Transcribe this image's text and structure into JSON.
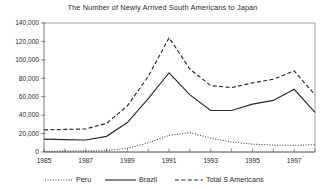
{
  "chart_data": {
    "type": "line",
    "title": "The Number of Newly Arrived South Americans to Japan",
    "xlabel": "",
    "ylabel": "",
    "x": [
      1985,
      1986,
      1987,
      1988,
      1989,
      1990,
      1991,
      1992,
      1993,
      1994,
      1995,
      1996,
      1997,
      1998
    ],
    "xlim": [
      1985,
      1998
    ],
    "ylim": [
      0,
      140000
    ],
    "ytick_values": [
      0,
      20000,
      40000,
      60000,
      80000,
      100000,
      120000,
      140000
    ],
    "ytick_labels": [
      "0",
      "20,000",
      "40,000",
      "60,000",
      "80,000",
      "100,000",
      "120,000",
      "140,000"
    ],
    "xtick_values": [
      1985,
      1987,
      1989,
      1991,
      1993,
      1995,
      1997
    ],
    "xtick_labels": [
      "1985",
      "1987",
      "1989",
      "1991",
      "1993",
      "1995",
      "1997"
    ],
    "xtick_minor": [
      1986,
      1988,
      1990,
      1992,
      1994,
      1996,
      1998
    ],
    "grid": false,
    "legend_position": "bottom",
    "series": [
      {
        "name": "Peru",
        "style": "dotted",
        "color": "#3a3a3a",
        "values": [
          700,
          1000,
          1100,
          1500,
          4000,
          10000,
          18000,
          21000,
          15000,
          11000,
          8500,
          7500,
          7200,
          8000
        ]
      },
      {
        "name": "Brazil",
        "style": "solid",
        "color": "#2a2a2a",
        "values": [
          14000,
          13500,
          13000,
          17000,
          32000,
          58000,
          86000,
          62000,
          45000,
          45000,
          52000,
          56000,
          68000,
          43000
        ]
      },
      {
        "name": "Total S Americans",
        "style": "dashed",
        "color": "#2a2a2a",
        "values": [
          24000,
          24500,
          25000,
          31000,
          50000,
          82000,
          124000,
          90000,
          72000,
          70000,
          75000,
          79000,
          88000,
          62000
        ]
      }
    ]
  },
  "legend": {
    "items": [
      {
        "label": "Peru",
        "style": "dotted"
      },
      {
        "label": "Brazil",
        "style": "solid"
      },
      {
        "label": "Total S Americans",
        "style": "dashed"
      }
    ]
  }
}
